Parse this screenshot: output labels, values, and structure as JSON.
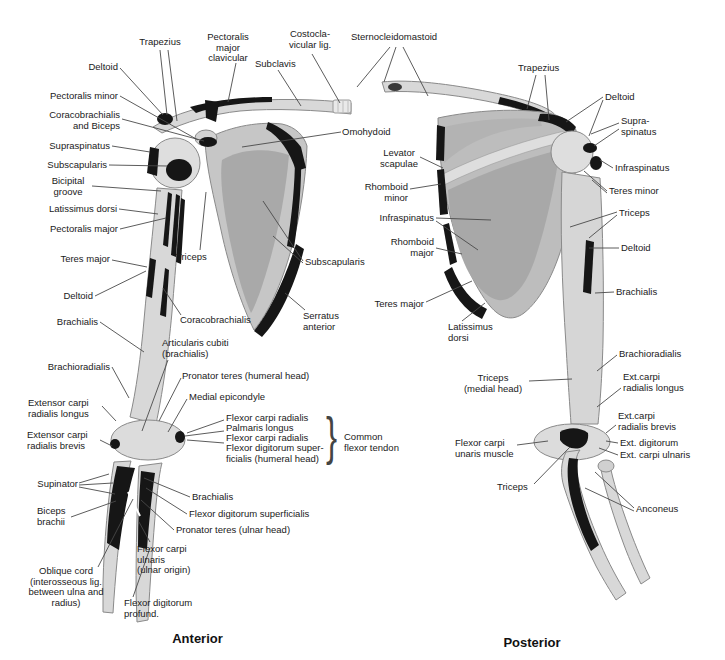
{
  "colors": {
    "background": "#ffffff",
    "label_text": "#1a1a1a",
    "bone_fill": "#d8d8d8",
    "fossa_fill": "#a9a9a9",
    "attachment_patch": "#161616",
    "leader_line": "#4a4a4a"
  },
  "anterior": {
    "caption": "Anterior",
    "brace": "}",
    "labels": [
      "Trapezius",
      "Deltoid",
      "Pectoralis minor",
      "Coracobrachialis\nand Biceps",
      "Supraspinatus",
      "Subscapularis",
      "Bicipital\ngroove",
      "Latissimus dorsi",
      "Pectoralis major",
      "Teres major",
      "Deltoid",
      "Brachialis",
      "Brachioradialis",
      "Extensor carpi\nradialis longus",
      "Extensor carpi\nradialis brevis",
      "Supinator",
      "Biceps\nbrachii",
      "Oblique cord\n(interosseous lig.\nbetween ulna and\nradius)",
      "Flexor digitorum\nprofund.",
      "Flexor carpi\nulnaris\n(ulnar origin)",
      "Pectoralis\nmajor\nclavicular",
      "Subclavis",
      "Costocla-\nvicular lig.",
      "Sternocleidomastoid",
      "Omohydoid",
      "Triceps",
      "Subscapularis",
      "Serratus\nanterior",
      "Coracobrachialis",
      "Articularis cubiti\n(brachialis)",
      "Pronator teres (humeral head)",
      "Medial epicondyle",
      "Flexor carpi radialis",
      "Palmaris longus",
      "Flexor carpi radialis",
      "Flexor digitorum super-\nficialis (humeral head)",
      "Common\nflexor tendon",
      "Brachialis",
      "Flexor digitorum superficialis",
      "Pronator teres (ulnar head)"
    ]
  },
  "posterior": {
    "caption": "Posterior",
    "labels": [
      "Trapezius",
      "Deltoid",
      "Supra-\nspinatus",
      "Infraspinatus",
      "Teres minor",
      "Triceps",
      "Deltoid",
      "Brachialis",
      "Brachioradialis",
      "Ext.carpi\nradialis longus",
      "Ext.carpi\nradialis brevis",
      "Ext. digitorum",
      "Ext. carpi ulnaris",
      "Levator\nscapulae",
      "Rhomboid\nminor",
      "Infraspinatus",
      "Rhomboid\nmajor",
      "Teres major",
      "Latissimus\ndorsi",
      "Triceps\n(medial head)",
      "Flexor carpi\nunaris muscle",
      "Triceps",
      "Anconeus"
    ]
  }
}
